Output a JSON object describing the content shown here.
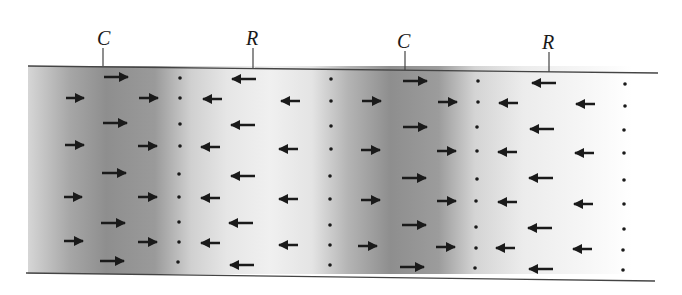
{
  "diagram": {
    "type": "longitudinal-wave-compression-rarefaction",
    "labels": [
      {
        "text": "C",
        "meaning": "compression",
        "x": 104
      },
      {
        "text": "R",
        "meaning": "rarefaction",
        "x": 253
      },
      {
        "text": "C",
        "meaning": "compression",
        "x": 404
      },
      {
        "text": "R",
        "meaning": "rarefaction",
        "x": 548
      }
    ],
    "colors": {
      "dark_band": "#8a8a8a",
      "light_band": "#efefef",
      "arrow": "#1a1a1a",
      "boundary": "#444444"
    }
  }
}
